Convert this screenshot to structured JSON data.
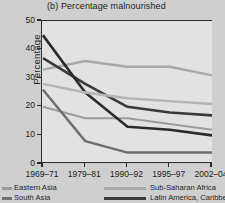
{
  "chart_data": {
    "type": "line",
    "title": "(b) Percentage malnourished",
    "xlabel": "",
    "ylabel": "Percentage",
    "ylim": [
      0,
      50
    ],
    "yticks": [
      0,
      10,
      20,
      30,
      40,
      50
    ],
    "grid": false,
    "legend_position": "bottom",
    "categories": [
      "1969–71",
      "1979–81",
      "1990–92",
      "1995–97",
      "2002–04"
    ],
    "series": [
      {
        "name": "Eastern Asia",
        "color": "#9c9c9c",
        "width": 2.0,
        "values": [
          20,
          16,
          16,
          14,
          12
        ]
      },
      {
        "name": "South Asia",
        "color": "#6e6e6e",
        "width": 2.4,
        "values": [
          26,
          8,
          4,
          4,
          4
        ]
      },
      {
        "name": "Sub-Saharan Africa",
        "color": "#a8a8a8",
        "width": 2.4,
        "values": [
          33,
          36,
          34,
          34,
          31
        ]
      },
      {
        "name": "Latin America, Caribbean",
        "color": "#3a3a3a",
        "width": 2.6,
        "values": [
          37,
          28,
          20,
          18,
          17
        ]
      },
      {
        "name": "",
        "color": "#2b2b2b",
        "width": 2.6,
        "values": [
          45,
          25,
          13,
          12,
          10
        ]
      },
      {
        "name": "",
        "color": "#b4b4b4",
        "width": 2.4,
        "values": [
          28,
          25,
          23,
          22,
          21
        ]
      }
    ],
    "legend": [
      {
        "label": "Eastern Asia",
        "color": "#9c9c9c",
        "col": 0,
        "row": 0
      },
      {
        "label": "South Asia",
        "color": "#6e6e6e",
        "col": 0,
        "row": 1
      },
      {
        "label": "Sub-Saharan Africa",
        "color": "#a8a8a8",
        "col": 1,
        "row": 0
      },
      {
        "label": "Latin America, Caribbean",
        "color": "#3a3a3a",
        "col": 1,
        "row": 1
      }
    ]
  },
  "figure": {
    "background": "#cfcfcf",
    "plot_background": "#e2e2e2",
    "axis_color": "#2b2b2b"
  }
}
